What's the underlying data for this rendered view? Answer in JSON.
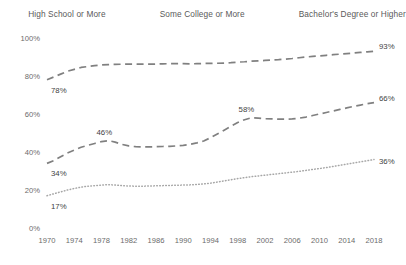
{
  "chart_data": {
    "type": "line",
    "title": "",
    "subtitle": "",
    "xlabel": "",
    "ylabel": "",
    "xlim": [
      1970,
      2018
    ],
    "ylim": [
      0,
      100
    ],
    "grid": false,
    "legend_position": "top",
    "y_ticks": [
      "0%",
      "20%",
      "40%",
      "60%",
      "80%",
      "100%"
    ],
    "y_tick_values": [
      0,
      20,
      40,
      60,
      80,
      100
    ],
    "x_ticks": [
      "1970",
      "1974",
      "1978",
      "1982",
      "1986",
      "1990",
      "1994",
      "1998",
      "2002",
      "2006",
      "2010",
      "2014",
      "2018"
    ],
    "x_tick_values": [
      1970,
      1974,
      1978,
      1982,
      1986,
      1990,
      1994,
      1998,
      2002,
      2006,
      2010,
      2014,
      2018
    ],
    "x": [
      1970,
      1971,
      1972,
      1973,
      1974,
      1975,
      1976,
      1977,
      1978,
      1979,
      1980,
      1981,
      1982,
      1983,
      1984,
      1985,
      1986,
      1987,
      1988,
      1989,
      1990,
      1991,
      1992,
      1993,
      1994,
      1995,
      1996,
      1997,
      1998,
      1999,
      2000,
      2001,
      2002,
      2003,
      2004,
      2005,
      2006,
      2007,
      2008,
      2009,
      2010,
      2011,
      2012,
      2013,
      2014,
      2015,
      2016,
      2017,
      2018
    ],
    "series": [
      {
        "name": "High School or More",
        "style": "solid",
        "color": "#808080",
        "values": [
          78,
          79.5,
          81,
          82.5,
          83.5,
          84.5,
          85,
          85.5,
          85.8,
          86,
          86.1,
          86.2,
          86.3,
          86.3,
          86.2,
          86.2,
          86.3,
          86.4,
          86.5,
          86.5,
          86.5,
          86.4,
          86.5,
          86.6,
          86.6,
          86.7,
          86.8,
          87,
          87.3,
          87.5,
          87.8,
          88,
          88.2,
          88.4,
          88.6,
          88.9,
          89.2,
          89.6,
          90,
          90.3,
          90.6,
          90.9,
          91.2,
          91.5,
          91.8,
          92.1,
          92.4,
          92.7,
          93
        ]
      },
      {
        "name": "Some College or More",
        "style": "dashed",
        "color": "#808080",
        "values": [
          34,
          35.5,
          37.5,
          39.5,
          41,
          42.5,
          43.5,
          44.5,
          45.5,
          46,
          45.2,
          44,
          43.2,
          42.8,
          42.7,
          42.7,
          42.8,
          42.9,
          43,
          43.2,
          43.5,
          44,
          44.8,
          45.8,
          47.5,
          49.5,
          51.5,
          53.5,
          55.5,
          57,
          58,
          57.8,
          57.5,
          57.4,
          57.3,
          57.3,
          57.4,
          57.8,
          58.4,
          59.2,
          60,
          60.8,
          61.6,
          62.4,
          63.2,
          64,
          64.7,
          65.4,
          66
        ]
      },
      {
        "name": "Bachelor's Degree or Higher",
        "style": "dotted",
        "color": "#a6a6a6",
        "values": [
          17,
          18,
          19,
          20,
          20.8,
          21.5,
          22,
          22.3,
          22.6,
          22.8,
          22.6,
          22.3,
          22.1,
          22,
          22,
          22.1,
          22.2,
          22.3,
          22.4,
          22.5,
          22.6,
          22.7,
          22.9,
          23.2,
          23.6,
          24.2,
          24.8,
          25.4,
          26,
          26.5,
          27,
          27.4,
          27.8,
          28.2,
          28.6,
          29,
          29.4,
          29.8,
          30.3,
          30.8,
          31.3,
          31.8,
          32.4,
          33,
          33.6,
          34.2,
          34.8,
          35.4,
          36
        ]
      }
    ],
    "point_labels": [
      {
        "series": "High School or More",
        "x": 1970,
        "value": 78,
        "text": "78%",
        "dx": 4,
        "dy": 13
      },
      {
        "series": "High School or More",
        "x": 2018,
        "value": 93,
        "text": "93%",
        "dx": 5,
        "dy": -2
      },
      {
        "series": "Some College or More",
        "x": 1970,
        "value": 34,
        "text": "34%",
        "dx": 4,
        "dy": 13
      },
      {
        "series": "Some College or More",
        "x": 1979,
        "value": 46,
        "text": "46%",
        "dx": -4,
        "dy": -6
      },
      {
        "series": "Some College or More",
        "x": 2000,
        "value": 58,
        "text": "58%",
        "dx": -5,
        "dy": -6
      },
      {
        "series": "Some College or More",
        "x": 2018,
        "value": 66,
        "text": "66%",
        "dx": 5,
        "dy": -2
      },
      {
        "series": "Bachelor's Degree or Higher",
        "x": 1970,
        "value": 17,
        "text": "17%",
        "dx": 4,
        "dy": 13
      },
      {
        "series": "Bachelor's Degree or Higher",
        "x": 2018,
        "value": 36,
        "text": "36%",
        "dx": 5,
        "dy": 4
      }
    ]
  },
  "legend": {
    "items": [
      {
        "label": "High School or More",
        "style": "solid",
        "color": "#808080"
      },
      {
        "label": "Some College or More",
        "style": "dashed",
        "color": "#808080"
      },
      {
        "label": "Bachelor's Degree or Higher",
        "style": "dotted",
        "color": "#a6a6a6"
      }
    ]
  }
}
